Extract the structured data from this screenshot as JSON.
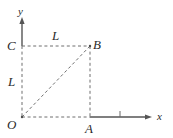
{
  "figure": {
    "kind": "geometry-diagram",
    "background_color": "#ffffff",
    "line_color": "#4d4d4d",
    "axis_color": "#555555",
    "label_color": "#2b2b2b",
    "axes": {
      "x_label": "x",
      "y_label": "y",
      "x_tick_count": 1
    },
    "points": {
      "origin": "O",
      "right": "A",
      "corner": "B",
      "top": "C"
    },
    "lengths": {
      "top": "L",
      "left": "L"
    }
  },
  "geometry": {
    "origin_x": 22,
    "origin_y": 117,
    "square_right_x": 90,
    "square_top_y": 46,
    "y_axis_arrow_y": 18,
    "x_axis_arrow_x": 151,
    "x_tick_x": 120
  }
}
